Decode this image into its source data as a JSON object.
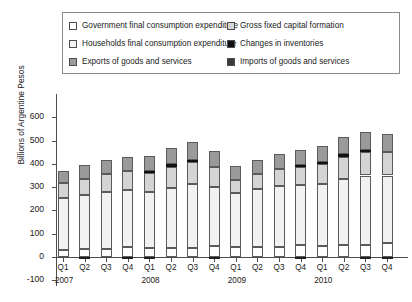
{
  "legend": {
    "entries": [
      {
        "label": "Government final consumption expenditure",
        "key": "government",
        "color": "#ffffff"
      },
      {
        "label": "Gross fixed capital formation",
        "key": "gfcf",
        "color": "#d4d4d4"
      },
      {
        "label": "Households final consumption expenditure",
        "key": "households",
        "color": "#f2f2f2"
      },
      {
        "label": "Changes in inventories",
        "key": "inventories",
        "color": "#111111"
      },
      {
        "label": "Exports of goods and services",
        "key": "exports",
        "color": "#9a9a9a"
      },
      {
        "label": "Imports of goods and services",
        "key": "imports",
        "color": "#3a3a3a"
      }
    ]
  },
  "chart_data": {
    "type": "bar",
    "subtype": "stacked",
    "title": "",
    "xlabel": "",
    "ylabel": "Billions of Argentine Pesos",
    "ylim": [
      -100,
      600
    ],
    "yticks": [
      600,
      500,
      400,
      300,
      200,
      100,
      0,
      -100
    ],
    "ytick_labels": [
      "600",
      "500",
      "400",
      "300",
      "200",
      "100",
      "0",
      "-100"
    ],
    "grid": false,
    "legend_position": "top",
    "categories": [
      "Q1",
      "Q2",
      "Q3",
      "Q4",
      "Q1",
      "Q2",
      "Q3",
      "Q4",
      "Q1",
      "Q2",
      "Q3",
      "Q4",
      "Q1",
      "Q2",
      "Q3",
      "Q4"
    ],
    "year_groups": [
      {
        "label": "2007",
        "start_index": 0
      },
      {
        "label": "2008",
        "start_index": 4
      },
      {
        "label": "2009",
        "start_index": 8
      },
      {
        "label": "2010",
        "start_index": 12
      }
    ],
    "series": [
      {
        "name": "Government final consumption expenditure",
        "key": "government",
        "color": "#ffffff",
        "values": [
          32,
          34,
          33,
          41,
          38,
          40,
          40,
          48,
          43,
          45,
          45,
          53,
          48,
          50,
          50,
          60
        ]
      },
      {
        "name": "Households final consumption expenditure",
        "key": "households",
        "color": "#f2f2f2",
        "values": [
          222,
          232,
          244,
          246,
          242,
          258,
          272,
          252,
          231,
          248,
          262,
          255,
          266,
          285,
          300,
          290
        ]
      },
      {
        "name": "Gross fixed capital formation",
        "key": "gfcf",
        "color": "#d4d4d4",
        "values": [
          62,
          70,
          78,
          82,
          80,
          90,
          95,
          85,
          55,
          62,
          70,
          78,
          85,
          95,
          100,
          100
        ]
      },
      {
        "name": "Changes in inventories",
        "key": "inventories",
        "color": "#111111",
        "values": [
          0,
          0,
          0,
          0,
          10,
          10,
          10,
          0,
          0,
          0,
          0,
          10,
          10,
          12,
          10,
          0
        ]
      },
      {
        "name": "Exports of goods and services",
        "key": "exports",
        "color": "#9a9a9a",
        "values": [
          52,
          58,
          62,
          60,
          62,
          72,
          75,
          70,
          60,
          62,
          65,
          62,
          68,
          75,
          78,
          80
        ]
      },
      {
        "name": "Imports of goods and services",
        "key": "imports",
        "color": "#3a3a3a",
        "values": [
          -45,
          -52,
          -58,
          -60,
          -62,
          -72,
          -78,
          -70,
          -48,
          -52,
          -58,
          -62,
          -68,
          -78,
          -85,
          -88
        ]
      }
    ],
    "bar_totals": [
      410,
      455,
      478,
      490,
      450,
      505,
      512,
      460,
      420,
      440,
      465,
      480,
      495,
      550,
      545,
      560
    ],
    "negative_offsets": [
      0,
      -2,
      0,
      -8,
      -6,
      0,
      0,
      -5,
      0,
      0,
      0,
      -2,
      0,
      0,
      -10,
      -2
    ]
  }
}
